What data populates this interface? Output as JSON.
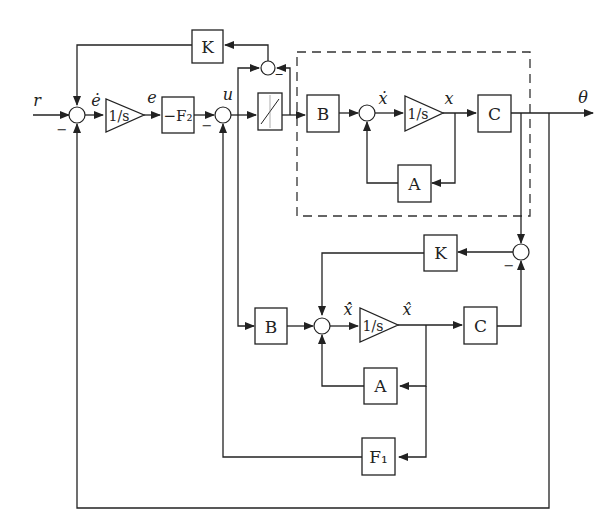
{
  "diagram": {
    "signals": {
      "r": "r",
      "e_dot": "ė",
      "e": "e",
      "u": "u",
      "x_dot": "ẋ",
      "x": "x",
      "theta": "θ",
      "xhat_dot": "x̂̇",
      "xhat": "x̂"
    },
    "blocks": {
      "k_top": "K",
      "integrator_1": "1/s",
      "f2": "−F₂",
      "saturation": "saturation",
      "b_plant": "B",
      "integrator_plant": "1/s",
      "c_plant": "C",
      "a_plant": "A",
      "k_observer": "K",
      "b_observer": "B",
      "integrator_observer": "1/s",
      "c_observer": "C",
      "a_observer": "A",
      "f1": "F₁"
    },
    "signs": {
      "minus": "−"
    },
    "plant_boundary": "dashed"
  }
}
